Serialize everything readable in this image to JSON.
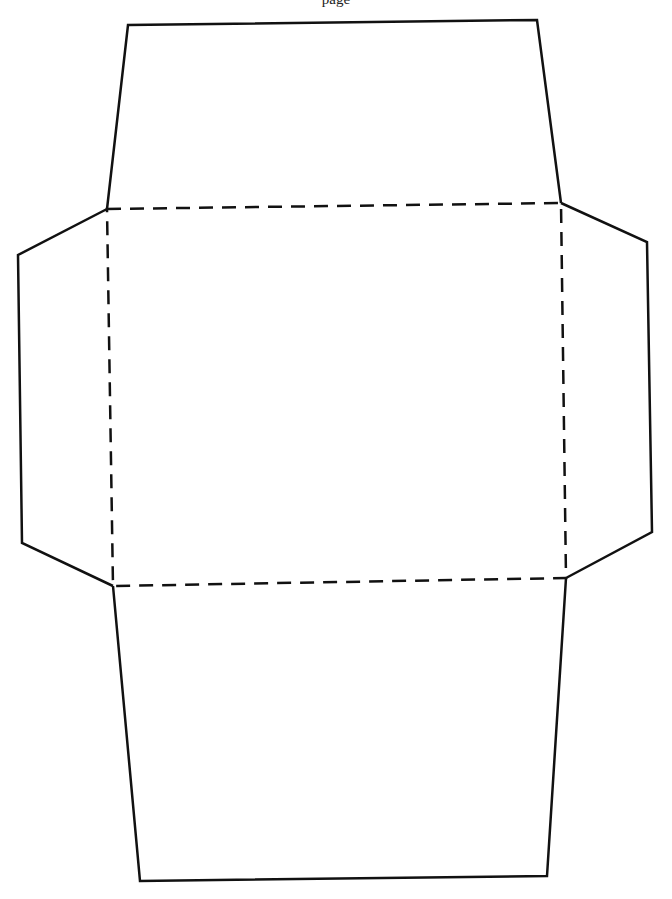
{
  "page": {
    "header_text": "page",
    "background": "#ffffff",
    "stroke_color": "#111111"
  },
  "template": {
    "type": "envelope-template",
    "fold_rect": [
      [
        107,
        209
      ],
      [
        561,
        203
      ],
      [
        566,
        578
      ],
      [
        113,
        586
      ]
    ],
    "top_flap": [
      [
        107,
        209
      ],
      [
        128,
        25
      ],
      [
        537,
        20
      ],
      [
        561,
        203
      ]
    ],
    "bottom_flap": [
      [
        113,
        586
      ],
      [
        140,
        881
      ],
      [
        547,
        876
      ],
      [
        566,
        578
      ]
    ],
    "left_flap": [
      [
        107,
        209
      ],
      [
        18,
        255
      ],
      [
        22,
        543
      ],
      [
        113,
        586
      ]
    ],
    "right_flap": [
      [
        561,
        203
      ],
      [
        647,
        242
      ],
      [
        652,
        532
      ],
      [
        566,
        578
      ]
    ]
  }
}
